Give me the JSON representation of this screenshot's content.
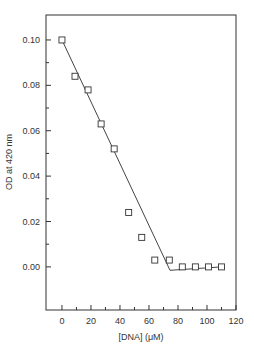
{
  "chart_data": {
    "type": "scatter",
    "title": "",
    "xlabel": "[DNA] (μM)",
    "ylabel": "OD at 420 nm",
    "xlim": [
      -11,
      120
    ],
    "ylim": [
      -0.019,
      0.111
    ],
    "x_ticks": [
      0,
      20,
      40,
      60,
      80,
      100,
      120
    ],
    "x_tick_labels": [
      "0",
      "20",
      "40",
      "60",
      "80",
      "100",
      "120"
    ],
    "x_minor_ticks": [
      10,
      30,
      50,
      70,
      90,
      110
    ],
    "y_ticks": [
      0.0,
      0.02,
      0.04,
      0.06,
      0.08,
      0.1
    ],
    "y_tick_labels": [
      "0.00",
      "0.02",
      "0.04",
      "0.06",
      "0.08",
      "0.10"
    ],
    "y_minor_ticks": [
      0.01,
      0.03,
      0.05,
      0.07,
      0.09
    ],
    "grid": false,
    "legend": null,
    "series": [
      {
        "name": "OD data",
        "marker": "open-square",
        "x": [
          0,
          9,
          18,
          27,
          36,
          46,
          55,
          64,
          74,
          83,
          92,
          101,
          110
        ],
        "y": [
          0.1,
          0.084,
          0.078,
          0.063,
          0.052,
          0.024,
          0.013,
          0.003,
          0.003,
          0.0,
          0.0,
          0.0,
          0.0
        ]
      },
      {
        "name": "Linear fit",
        "marker": "none",
        "line": "solid",
        "x": [
          0,
          74.5,
          110
        ],
        "y": [
          0.1,
          -0.0015,
          0.0
        ]
      }
    ],
    "colors": {
      "axis": "#333333",
      "marker": "#333333",
      "line": "#444444"
    }
  }
}
